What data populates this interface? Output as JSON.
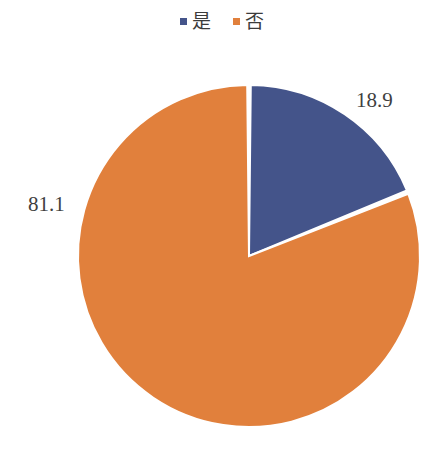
{
  "legend": {
    "position": "top-center",
    "items": [
      {
        "label": "是",
        "color": "#44548A",
        "marker": "square-marker"
      },
      {
        "label": "否",
        "color": "#E1803C",
        "marker": "square-marker"
      }
    ]
  },
  "labels": {
    "blue_value": "18.9",
    "orange_value": "81.1"
  },
  "chart_data": {
    "type": "pie",
    "title": "",
    "subtitle": "",
    "xlabel": "",
    "ylabel": "",
    "grid": false,
    "legend_position": "top-center",
    "start_angle_deg": 0,
    "direction": "clockwise",
    "slice_gap_deg": 1.2,
    "categories": [
      "是",
      "否"
    ],
    "values": [
      18.9,
      81.1
    ],
    "units": "percent",
    "data_labels": [
      "18.9",
      "81.1"
    ],
    "data_label_position": "outside",
    "colors": [
      "#44548A",
      "#E1803C"
    ],
    "slices": [
      {
        "name": "是",
        "value": 18.9,
        "color": "#44548A",
        "label": "18.9",
        "start_deg": 0,
        "sweep_deg": 68.04
      },
      {
        "name": "否",
        "value": 81.1,
        "color": "#E1803C",
        "label": "81.1",
        "start_deg": 68.04,
        "sweep_deg": 291.96
      }
    ],
    "geometry": {
      "center_x": 249,
      "center_y": 256,
      "radius": 171
    },
    "background": "#FFFFFF",
    "separator_color": "#FFFFFF"
  }
}
